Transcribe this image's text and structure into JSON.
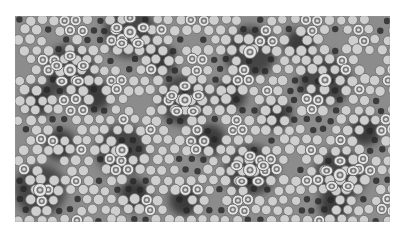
{
  "image": {
    "description": "Grayscale quasicrystalline (tenfold/fivefold) tiling pattern with light discs, ringed discs and dark clusters",
    "frame": {
      "x": 15,
      "y": 16,
      "width": 375,
      "height": 206
    },
    "colors": {
      "page_bg": "#ffffff",
      "matrix": "#8c8c8c",
      "dark": "#3a3a3a",
      "darker": "#262626",
      "disc": "#cfcfcf",
      "disc_edge": "#6a6a6a",
      "ring": "#e6e6e6",
      "ring_core": "#7a7a7a",
      "ring_center": "#d8d8d8"
    },
    "rosette_centers": [
      [
        70,
        70
      ],
      [
        122,
        150
      ],
      [
        185,
        100
      ],
      [
        250,
        52
      ],
      [
        250,
        170
      ],
      [
        325,
        80
      ],
      [
        340,
        175
      ],
      [
        40,
        190
      ],
      [
        130,
        32
      ]
    ],
    "dark_clusters": [
      [
        40,
        100
      ],
      [
        95,
        95
      ],
      [
        160,
        60
      ],
      [
        210,
        140
      ],
      [
        275,
        115
      ],
      [
        300,
        45
      ],
      [
        365,
        130
      ],
      [
        185,
        200
      ],
      [
        60,
        145
      ],
      [
        335,
        205
      ],
      [
        135,
        195
      ],
      [
        230,
        95
      ]
    ]
  }
}
